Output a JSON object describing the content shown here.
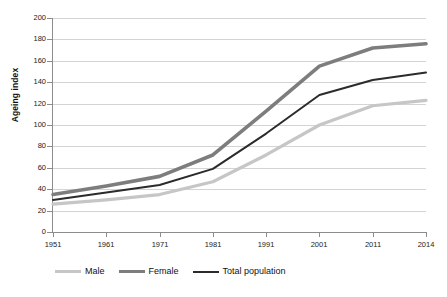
{
  "chart_data": {
    "type": "line",
    "title": "",
    "xlabel": "",
    "ylabel": "Ageing index",
    "ylim": [
      0,
      200
    ],
    "ytick_step": 20,
    "grid": true,
    "legend_position": "bottom",
    "categories": [
      "1951",
      "1961",
      "1971",
      "1981",
      "1991",
      "2001",
      "2011",
      "2014"
    ],
    "yticks": [
      "0",
      "20",
      "40",
      "60",
      "80",
      "100",
      "120",
      "140",
      "160",
      "180",
      "200"
    ],
    "series": [
      {
        "name": "Male",
        "color": "#c6c6c6",
        "width": 3.2,
        "values": [
          26,
          30,
          35,
          47,
          72,
          100,
          118,
          123
        ]
      },
      {
        "name": "Female",
        "color": "#7d7d7d",
        "width": 3.6,
        "values": [
          35,
          43,
          52,
          72,
          113,
          155,
          172,
          176
        ]
      },
      {
        "name": "Total population",
        "color": "#2b2b2b",
        "width": 2.0,
        "values": [
          30,
          37,
          44,
          59,
          92,
          128,
          142,
          149
        ]
      }
    ]
  },
  "legend": {
    "items": [
      {
        "label": "Male",
        "color": "#c6c6c6",
        "width": 3.2
      },
      {
        "label": "Female",
        "color": "#7d7d7d",
        "width": 3.6
      },
      {
        "label": "Total population",
        "color": "#2b2b2b",
        "width": 2.0
      }
    ]
  },
  "colors": {
    "grid": "#d4d4d4",
    "axis": "#8d8d8d",
    "text": "#1a1a1a",
    "background": "#ffffff"
  }
}
